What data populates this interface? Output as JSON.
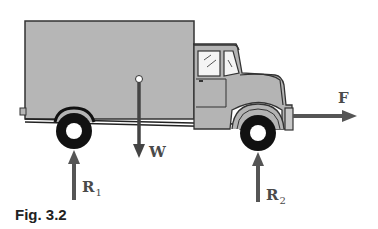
{
  "figure": {
    "caption": "Fig. 3.2"
  },
  "labels": {
    "force": "F",
    "weight": "W",
    "reaction_rear": "R",
    "reaction_rear_sub": "1",
    "reaction_front": "R",
    "reaction_front_sub": "2"
  },
  "colors": {
    "body_fill": "#b4b4b4",
    "outline": "#333333",
    "arrow": "#555555",
    "tire": "#111111"
  }
}
